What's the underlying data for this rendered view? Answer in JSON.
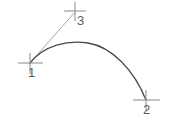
{
  "drawing": {
    "title": "Arc defined by three points",
    "background_color": "#ffffff",
    "stroke_color": "#4a4a4a",
    "marker_color": "#8a8a8a",
    "radius_line_color": "#9a9a9a",
    "label_color": "#5b5b5b",
    "width": 173,
    "height": 125
  },
  "points": [
    {
      "id": "1",
      "label": "1",
      "role": "arc-start-point",
      "x": 30,
      "y": 63,
      "label_x": 28,
      "label_y": 66,
      "marker": "cross-marker",
      "marker_half_width": 12,
      "marker_half_height": 10
    },
    {
      "id": "2",
      "label": "2",
      "role": "arc-end-point",
      "x": 146,
      "y": 100,
      "label_x": 143,
      "label_y": 103,
      "marker": "cross-marker",
      "marker_half_width": 13,
      "marker_half_height": 10
    },
    {
      "id": "3",
      "label": "3",
      "role": "arc-reference-point",
      "x": 75,
      "y": 11,
      "label_x": 77,
      "label_y": 14,
      "marker": "cross-marker",
      "marker_half_width": 11,
      "marker_half_height": 9
    }
  ],
  "arc": {
    "name": "curved-arc",
    "start_x": 30,
    "start_y": 63,
    "apex_x": 86,
    "apex_y": 41,
    "end_x": 146,
    "end_y": 100,
    "path": "M 30 63 C 44 45, 68 40, 88 43 C 112 47, 134 70, 146 100",
    "stroke_width": 1.3
  },
  "radius_line": {
    "name": "radius-construction-line",
    "from_x": 30,
    "from_y": 63,
    "to_x": 75,
    "to_y": 12,
    "stroke_width": 0.9
  }
}
